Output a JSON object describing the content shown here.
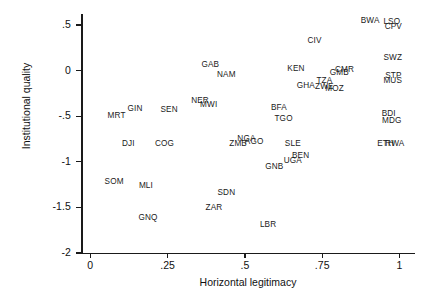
{
  "chart_data": {
    "type": "scatter",
    "title": "",
    "xlabel": "Horizontal legitimacy",
    "ylabel": "Institutional quality",
    "xlim": [
      -0.03,
      1.05
    ],
    "ylim": [
      -2.0,
      0.62
    ],
    "xticks": [
      "0",
      ".25",
      ".5",
      ".75",
      "1"
    ],
    "xtick_values": [
      0,
      0.25,
      0.5,
      0.75,
      1
    ],
    "yticks": [
      ".5",
      "0",
      "-.5",
      "-1",
      "-1.5",
      "-2"
    ],
    "ytick_values": [
      0.5,
      0,
      -0.5,
      -1,
      -1.5,
      -2
    ],
    "grid": false,
    "legend": null,
    "marker_style": "text-label",
    "points": [
      {
        "label": "BWA",
        "x": 0.905,
        "y": 0.555
      },
      {
        "label": "LSO",
        "x": 0.975,
        "y": 0.545
      },
      {
        "label": "CPV",
        "x": 0.98,
        "y": 0.49
      },
      {
        "label": "CIV",
        "x": 0.725,
        "y": 0.335
      },
      {
        "label": "SWZ",
        "x": 0.978,
        "y": 0.15
      },
      {
        "label": "GAB",
        "x": 0.388,
        "y": 0.075
      },
      {
        "label": "KEN",
        "x": 0.665,
        "y": 0.03
      },
      {
        "label": "CMR",
        "x": 0.822,
        "y": 0.02
      },
      {
        "label": "GMB",
        "x": 0.805,
        "y": -0.015
      },
      {
        "label": "NAM",
        "x": 0.44,
        "y": -0.04
      },
      {
        "label": "STP",
        "x": 0.98,
        "y": -0.045
      },
      {
        "label": "TZA",
        "x": 0.757,
        "y": -0.1
      },
      {
        "label": "MUS",
        "x": 0.978,
        "y": -0.105
      },
      {
        "label": "GHA",
        "x": 0.697,
        "y": -0.16
      },
      {
        "label": "ZWE",
        "x": 0.757,
        "y": -0.165
      },
      {
        "label": "MOZ",
        "x": 0.79,
        "y": -0.19
      },
      {
        "label": "NER",
        "x": 0.355,
        "y": -0.32
      },
      {
        "label": "MWI",
        "x": 0.383,
        "y": -0.365
      },
      {
        "label": "BFA",
        "x": 0.61,
        "y": -0.395
      },
      {
        "label": "GIN",
        "x": 0.145,
        "y": -0.415
      },
      {
        "label": "SEN",
        "x": 0.255,
        "y": -0.42
      },
      {
        "label": "BDI",
        "x": 0.965,
        "y": -0.47
      },
      {
        "label": "MRT",
        "x": 0.085,
        "y": -0.49
      },
      {
        "label": "TGO",
        "x": 0.625,
        "y": -0.52
      },
      {
        "label": "MDG",
        "x": 0.975,
        "y": -0.545
      },
      {
        "label": "NGA",
        "x": 0.505,
        "y": -0.735
      },
      {
        "label": "AGO",
        "x": 0.53,
        "y": -0.775
      },
      {
        "label": "DJI",
        "x": 0.123,
        "y": -0.79
      },
      {
        "label": "COG",
        "x": 0.24,
        "y": -0.79
      },
      {
        "label": "ZMB",
        "x": 0.478,
        "y": -0.79
      },
      {
        "label": "SLE",
        "x": 0.655,
        "y": -0.79
      },
      {
        "label": "ETH",
        "x": 0.955,
        "y": -0.79
      },
      {
        "label": "RWA",
        "x": 0.985,
        "y": -0.79
      },
      {
        "label": "BEN",
        "x": 0.68,
        "y": -0.925
      },
      {
        "label": "UGA",
        "x": 0.655,
        "y": -0.985
      },
      {
        "label": "GNB",
        "x": 0.595,
        "y": -1.05
      },
      {
        "label": "SOM",
        "x": 0.077,
        "y": -1.215
      },
      {
        "label": "MLI",
        "x": 0.18,
        "y": -1.25
      },
      {
        "label": "SDN",
        "x": 0.44,
        "y": -1.335
      },
      {
        "label": "ZAR",
        "x": 0.4,
        "y": -1.5
      },
      {
        "label": "GNQ",
        "x": 0.187,
        "y": -1.605
      },
      {
        "label": "LBR",
        "x": 0.575,
        "y": -1.68
      }
    ]
  }
}
